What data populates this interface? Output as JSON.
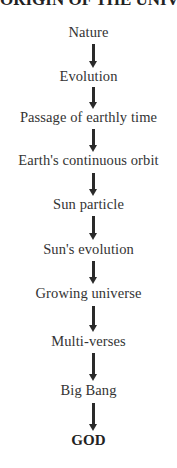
{
  "header": {
    "partial_title": "ORIGIN OF THE UNIVERSE"
  },
  "flow": {
    "nodes": [
      {
        "label": "Nature"
      },
      {
        "label": "Evolution"
      },
      {
        "label": "Passage of earthly time"
      },
      {
        "label": "Earth's continuous orbit"
      },
      {
        "label": "Sun particle"
      },
      {
        "label": "Sun's evolution"
      },
      {
        "label": "Growing universe"
      },
      {
        "label": "Multi-verses"
      },
      {
        "label": "Big Bang"
      },
      {
        "label": "GOD"
      }
    ],
    "arrow_icon": "down-arrow-icon",
    "colors": {
      "text": "#333333",
      "arrow": "#2a2a2a",
      "background": "#ffffff"
    }
  }
}
